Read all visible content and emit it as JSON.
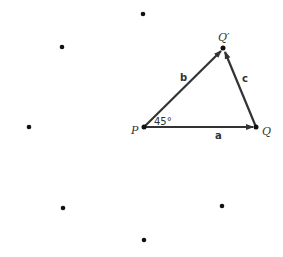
{
  "diagram": {
    "points": {
      "P": {
        "label": "P"
      },
      "Q": {
        "label": "Q"
      },
      "Qprime": {
        "label": "Q′"
      }
    },
    "vectors": {
      "a": {
        "label": "a"
      },
      "b": {
        "label": "b"
      },
      "c": {
        "label": "c"
      }
    },
    "angle": {
      "label": "45°"
    },
    "dot_count": 9,
    "colors": {
      "line": "#333333",
      "dot": "#111111"
    }
  }
}
